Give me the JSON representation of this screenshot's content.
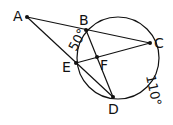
{
  "diagram": {
    "type": "circle-geometry",
    "stroke_color": "#111111",
    "circle": {
      "cx": 118,
      "cy": 58,
      "r": 41
    },
    "points": [
      {
        "name": "A",
        "x": 27,
        "y": 17
      },
      {
        "name": "B",
        "x": 86,
        "y": 30
      },
      {
        "name": "C",
        "x": 150,
        "y": 43
      },
      {
        "name": "E",
        "x": 76,
        "y": 63
      },
      {
        "name": "F",
        "x": 97,
        "y": 57
      },
      {
        "name": "D",
        "x": 113,
        "y": 97
      }
    ],
    "labels": {
      "A": "A",
      "B": "B",
      "C": "C",
      "E": "E",
      "F": "F",
      "D": "D"
    },
    "segments": [
      [
        "A",
        "C"
      ],
      [
        "A",
        "D"
      ],
      [
        "B",
        "D"
      ],
      [
        "E",
        "C"
      ],
      [
        "E",
        "D"
      ]
    ],
    "arc_labels": {
      "be": "50°",
      "cd": "110°"
    }
  }
}
